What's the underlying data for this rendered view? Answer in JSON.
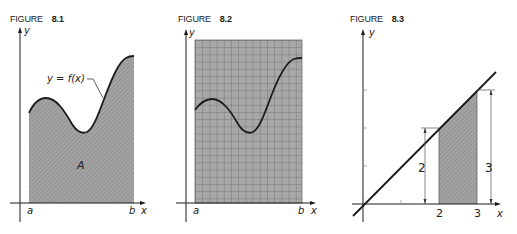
{
  "figures": [
    {
      "id": "8.1",
      "label_word": "FIGURE",
      "label_num": "8.1",
      "axis_y": "y",
      "axis_x": "x",
      "tick_a": "a",
      "tick_b": "b",
      "curve_label": "y = f(x)",
      "area_label": "A",
      "description": "Shaded area A under curve y = f(x) from a to b"
    },
    {
      "id": "8.2",
      "label_word": "FIGURE",
      "label_num": "8.2",
      "axis_y": "y",
      "axis_x": "x",
      "tick_a": "a",
      "tick_b": "b",
      "description": "Rectangle from a to b covered by a square grid, with curve overlaid"
    },
    {
      "id": "8.3",
      "label_word": "FIGURE",
      "label_num": "8.3",
      "axis_y": "y",
      "axis_x": "x",
      "tick_2": "2",
      "tick_3": "3",
      "height_left": "2",
      "height_right": "3",
      "description": "Line y = x with shaded trapezoid between x = 2 and x = 3"
    }
  ],
  "colors": {
    "ink": "#1a1a1a",
    "shade": "#9a9a9a",
    "grid_fill": "#a8a8a8",
    "grid_line": "#6f6f6f"
  }
}
